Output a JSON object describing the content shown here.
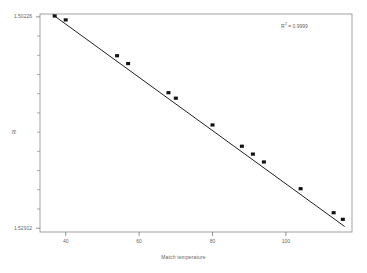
{
  "chart_data": {
    "type": "scatter",
    "title": "",
    "xlabel": "Match temperature",
    "ylabel": "RI",
    "xlim": [
      33,
      118
    ],
    "ylim": [
      1.5019,
      1.5296
    ],
    "y_inverted": true,
    "grid": false,
    "legend": null,
    "annotations": [
      {
        "text": "R² = 0.9999",
        "r2_base": "R",
        "r2_sup": "2",
        "r2_rest": " = 0.9999",
        "x": 110,
        "y": 1.5026
      }
    ],
    "xticks": [
      40,
      60,
      80,
      100
    ],
    "xtick_labels": [
      "40",
      "60",
      "80",
      "100"
    ],
    "yticks": [
      1.50226,
      1.52912
    ],
    "ytick_labels": [
      "1.50226",
      "1.52912"
    ],
    "ytick_minor_count": 11,
    "series": [
      {
        "name": "RI vs Match temperature",
        "marker": "filled-square",
        "marker_color": "#111111",
        "line_color": "#222222",
        "x": [
          37.0,
          40.0,
          54.0,
          57.0,
          68.0,
          70.0,
          80.0,
          88.0,
          91.0,
          94.0,
          104.0,
          113.0,
          115.5
        ],
        "y": [
          1.50215,
          1.50265,
          1.5072,
          1.5082,
          1.5119,
          1.5126,
          1.516,
          1.5187,
          1.5197,
          1.5207,
          1.5241,
          1.52715,
          1.52799
        ]
      }
    ],
    "fit_line": {
      "x_start": 36.5,
      "x_end": 116.0,
      "y_start": 1.502,
      "y_end": 1.5289,
      "color": "#222222"
    }
  },
  "frame": {
    "border_color": "#8a8a8a",
    "background": "#ffffff"
  }
}
